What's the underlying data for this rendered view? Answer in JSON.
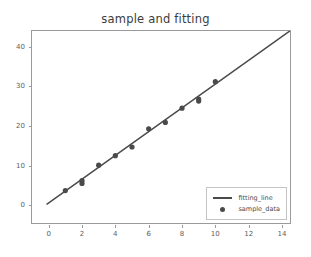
{
  "chart_data": {
    "type": "scatter",
    "title": "sample and fitting",
    "xlabel": "",
    "ylabel": "",
    "xlim": [
      -1.0,
      14.6
    ],
    "ylim": [
      -5.0,
      44.0
    ],
    "grid": false,
    "legend_position": "lower right",
    "xticks": [
      0,
      2,
      4,
      6,
      8,
      10,
      12,
      14
    ],
    "yticks": [
      0,
      10,
      20,
      30,
      40
    ],
    "xtick_labels": [
      "0",
      "2",
      "4",
      "6",
      "8",
      "10",
      "12",
      "14"
    ],
    "ytick_labels": [
      "0",
      "10",
      "20",
      "30",
      "40"
    ],
    "series": [
      {
        "name": "fitting_line",
        "type": "line",
        "color": "#4a4a4a",
        "x": [
          -0.1,
          15.0
        ],
        "y": [
          0.3,
          45.6
        ]
      },
      {
        "name": "sample_data",
        "type": "scatter",
        "color": "#4a4a4a",
        "x": [
          1,
          2,
          2,
          3,
          4,
          5,
          6,
          7,
          8,
          9,
          9,
          10
        ],
        "y": [
          3.7,
          5.5,
          6.2,
          10.1,
          12.5,
          14.7,
          19.3,
          20.9,
          24.5,
          26.3,
          26.8,
          31.2
        ]
      }
    ],
    "legend": [
      {
        "label": "fitting_line",
        "marker": "line"
      },
      {
        "label": "sample_data",
        "marker": "dot"
      }
    ]
  },
  "colors": {
    "foreground": "#4a4a4a",
    "axis": "#9a9a9a",
    "tick_text": "#5e5e5e",
    "title_text": "#3c3c3c",
    "background": "#ffffff"
  }
}
